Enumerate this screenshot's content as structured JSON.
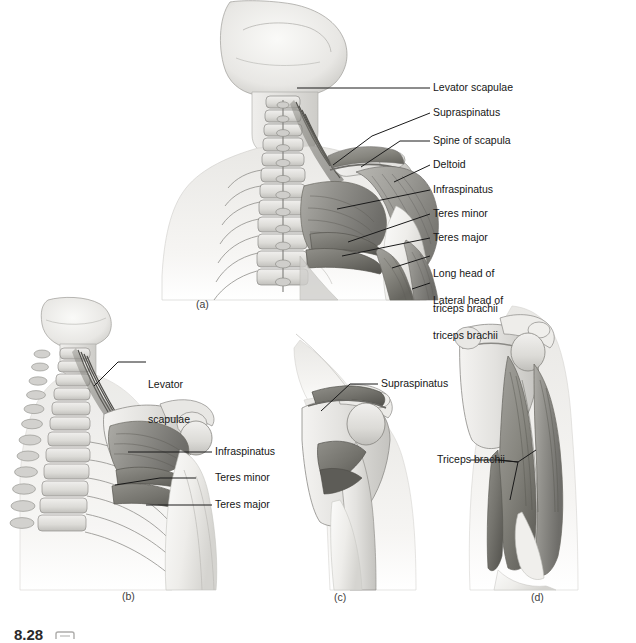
{
  "figure": {
    "caption_number": "8.28",
    "caption_icon": "media-icon"
  },
  "panels": [
    {
      "letter": "(a)",
      "name": "superficial-posterior-shoulder",
      "labels": [
        {
          "text": "Levator scapulae",
          "lines": [
            "Levator scapulae"
          ]
        },
        {
          "text": "Supraspinatus",
          "lines": [
            "Supraspinatus"
          ]
        },
        {
          "text": "Spine of scapula",
          "lines": [
            "Spine of scapula"
          ]
        },
        {
          "text": "Deltoid",
          "lines": [
            "Deltoid"
          ]
        },
        {
          "text": "Infraspinatus",
          "lines": [
            "Infraspinatus"
          ]
        },
        {
          "text": "Teres minor",
          "lines": [
            "Teres minor"
          ]
        },
        {
          "text": "Teres major",
          "lines": [
            "Teres major"
          ]
        },
        {
          "text": "Long head of triceps brachii",
          "lines": [
            "Long head of",
            "triceps brachii"
          ]
        },
        {
          "text": "Lateral head of triceps brachii",
          "lines": [
            "Lateral head of",
            "triceps brachii"
          ]
        }
      ]
    },
    {
      "letter": "(b)",
      "name": "deep-posterior-shoulder-with-spine",
      "labels": [
        {
          "text": "Levator scapulae",
          "lines": [
            "Levator",
            "scapulae"
          ]
        },
        {
          "text": "Infraspinatus",
          "lines": [
            "Infraspinatus"
          ]
        },
        {
          "text": "Teres minor",
          "lines": [
            "Teres minor"
          ]
        },
        {
          "text": "Teres major",
          "lines": [
            "Teres major"
          ]
        }
      ]
    },
    {
      "letter": "(c)",
      "name": "rotator-cuff-lateral-view",
      "labels": [
        {
          "text": "Supraspinatus",
          "lines": [
            "Supraspinatus"
          ]
        }
      ]
    },
    {
      "letter": "(d)",
      "name": "triceps-brachii-posterior-arm",
      "labels": [
        {
          "text": "Triceps brachii",
          "lines": [
            "Triceps brachii"
          ]
        }
      ]
    }
  ],
  "colors": {
    "background": "#ffffff",
    "leader_line": "#1a1a1a",
    "text": "#161616",
    "bone_light": "#ededec",
    "bone_mid": "#d8d7d4",
    "bone_shadow": "#bdbcb8",
    "muscle_light": "#b4b3ae",
    "muscle_mid": "#9a9994",
    "muscle_dark": "#7c7b77",
    "muscle_deep": "#5f5e5b",
    "outline": "#6e6d69",
    "skin_pale": "#f2f1ef"
  }
}
